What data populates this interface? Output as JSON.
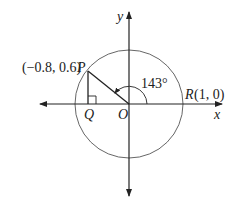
{
  "diagram": {
    "axes": {
      "x_label": "x",
      "y_label": "y"
    },
    "points": {
      "P": {
        "label_coords": "(−0.8, 0.6)",
        "label_name": "P",
        "x": -0.8,
        "y": 0.6
      },
      "Q": {
        "label_name": "Q",
        "x": -0.8,
        "y": 0
      },
      "O": {
        "label_name": "O",
        "x": 0,
        "y": 0
      },
      "R": {
        "label_name": "R",
        "label_coords": "(1, 0)",
        "x": 1,
        "y": 0
      }
    },
    "angle": {
      "label": "143°",
      "degrees": 143
    },
    "circle": {
      "radius": 1
    },
    "colors": {
      "line": "#222222",
      "circle": "#555555",
      "background": "#ffffff"
    }
  }
}
